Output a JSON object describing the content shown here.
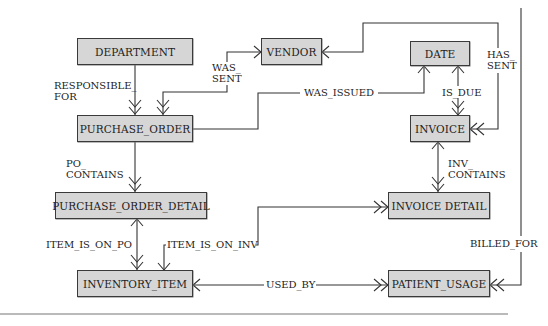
{
  "diagram": {
    "type": "entity-relationship",
    "entities": [
      {
        "id": "department",
        "label": "DEPARTMENT"
      },
      {
        "id": "vendor",
        "label": "VENDOR"
      },
      {
        "id": "date",
        "label": "DATE"
      },
      {
        "id": "purchase_order",
        "label": "PURCHASE_ORDER"
      },
      {
        "id": "invoice",
        "label": "INVOICE"
      },
      {
        "id": "purchase_order_detail",
        "label": "PURCHASE_ORDER_DETAIL"
      },
      {
        "id": "invoice_detail",
        "label": "INVOICE DETAIL"
      },
      {
        "id": "inventory_item",
        "label": "INVENTORY_ITEM"
      },
      {
        "id": "patient_usage",
        "label": "PATIENT_USAGE"
      }
    ],
    "relationships": [
      {
        "id": "responsible_for",
        "label_line1": "RESPONSIBLE_",
        "label_line2": "FOR",
        "from": "DEPARTMENT",
        "to": "PURCHASE_ORDER",
        "cardinality": "one-to-many"
      },
      {
        "id": "was_sent",
        "label_line1": "WAS_",
        "label_line2": "SENT",
        "from": "VENDOR",
        "to": "PURCHASE_ORDER",
        "cardinality": "one-to-many"
      },
      {
        "id": "was_issued",
        "label": "WAS_ISSUED",
        "from": "PURCHASE_ORDER",
        "to": "DATE",
        "cardinality": "many-to-one"
      },
      {
        "id": "has_sent",
        "label_line1": "HAS_",
        "label_line2": "SENT",
        "from": "VENDOR",
        "to": "INVOICE",
        "cardinality": "one-to-many"
      },
      {
        "id": "is_due",
        "label": "IS_DUE",
        "from": "DATE",
        "to": "INVOICE",
        "cardinality": "one-to-many"
      },
      {
        "id": "po_contains",
        "label_line1": "PO_",
        "label_line2": "CONTAINS",
        "from": "PURCHASE_ORDER",
        "to": "PURCHASE_ORDER_DETAIL",
        "cardinality": "one-to-many"
      },
      {
        "id": "inv_contains",
        "label_line1": "INV_",
        "label_line2": "CONTAINS",
        "from": "INVOICE",
        "to": "INVOICE DETAIL",
        "cardinality": "one-to-many"
      },
      {
        "id": "item_is_on_po",
        "label": "ITEM_IS_ON_PO",
        "from": "PURCHASE_ORDER_DETAIL",
        "to": "INVENTORY_ITEM",
        "cardinality": "one-to-many"
      },
      {
        "id": "item_is_on_inv",
        "label": "ITEM_IS_ON_INV",
        "from": "INVOICE DETAIL",
        "to": "INVENTORY_ITEM",
        "cardinality": "many-to-many"
      },
      {
        "id": "used_by",
        "label": "USED_BY",
        "from": "INVENTORY_ITEM",
        "to": "PATIENT_USAGE",
        "cardinality": "one-to-many"
      },
      {
        "id": "billed_for",
        "label": "BILLED_FOR",
        "from": "INVOICE",
        "to": "PATIENT_USAGE",
        "cardinality": "one-to-many"
      }
    ]
  },
  "colors": {
    "entity_fill": "#d6d6d6",
    "entity_border": "#3a3a3a",
    "line": "#333333"
  }
}
